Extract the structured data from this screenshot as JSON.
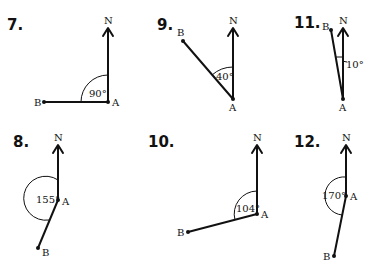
{
  "problems": [
    {
      "number": "7.",
      "north_label": "N",
      "point_a_label": "A",
      "point_b_label": "B",
      "angle_label": "90°",
      "angle_degrees": 90,
      "b_direction": "west of north (counter-clockwise)"
    },
    {
      "number": "8.",
      "north_label": "N",
      "point_a_label": "A",
      "point_b_label": "B",
      "angle_label": "155°",
      "angle_degrees": 155,
      "b_direction": "west of north (counter-clockwise)"
    },
    {
      "number": "9.",
      "north_label": "N",
      "point_a_label": "A",
      "point_b_label": "B",
      "angle_label": "40°",
      "angle_degrees": 40,
      "b_direction": "west of north (counter-clockwise)"
    },
    {
      "number": "10.",
      "north_label": "N",
      "point_a_label": "A",
      "point_b_label": "B",
      "angle_label": "104°",
      "angle_degrees": 104,
      "b_direction": "west of north (counter-clockwise)"
    },
    {
      "number": "11.",
      "north_label": "N",
      "point_a_label": "A",
      "point_b_label": "B",
      "angle_label": "10°",
      "angle_degrees": 10,
      "b_direction": "west of north (counter-clockwise)"
    },
    {
      "number": "12.",
      "north_label": "N",
      "point_a_label": "A",
      "point_b_label": "B",
      "angle_label": "170°",
      "angle_degrees": 170,
      "b_direction": "west of north (counter-clockwise)"
    }
  ]
}
